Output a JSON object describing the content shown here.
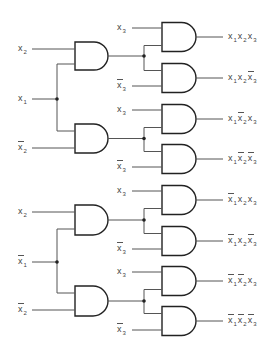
{
  "diagram": {
    "title": "Two-level AND decoder for x1, x2, x3 (minterm generator)",
    "stage1": {
      "inputs_top": [
        {
          "id": "in-x2-a",
          "terms": [
            {
              "var": "x",
              "sub": "2",
              "neg": false
            }
          ],
          "y": 49
        },
        {
          "id": "in-x1",
          "terms": [
            {
              "var": "x",
              "sub": "1",
              "neg": false
            }
          ],
          "y": 99
        },
        {
          "id": "in-x2bar-a",
          "terms": [
            {
              "var": "x",
              "sub": "2",
              "neg": true
            }
          ],
          "y": 148
        }
      ],
      "inputs_bottom": [
        {
          "id": "in-x2-b",
          "terms": [
            {
              "var": "x",
              "sub": "2",
              "neg": false
            }
          ],
          "y": 212
        },
        {
          "id": "in-x1bar",
          "terms": [
            {
              "var": "x",
              "sub": "1",
              "neg": true
            }
          ],
          "y": 262
        },
        {
          "id": "in-x2bar-b",
          "terms": [
            {
              "var": "x",
              "sub": "2",
              "neg": true
            }
          ],
          "y": 310
        }
      ]
    },
    "stage2_inputs": [
      {
        "terms": [
          {
            "var": "x",
            "sub": "3",
            "neg": false
          }
        ],
        "y": 28
      },
      {
        "terms": [
          {
            "var": "x",
            "sub": "3",
            "neg": true
          }
        ],
        "y": 86
      },
      {
        "terms": [
          {
            "var": "x",
            "sub": "3",
            "neg": false
          }
        ],
        "y": 110
      },
      {
        "terms": [
          {
            "var": "x",
            "sub": "3",
            "neg": true
          }
        ],
        "y": 167
      },
      {
        "terms": [
          {
            "var": "x",
            "sub": "3",
            "neg": false
          }
        ],
        "y": 191
      },
      {
        "terms": [
          {
            "var": "x",
            "sub": "3",
            "neg": true
          }
        ],
        "y": 249
      },
      {
        "terms": [
          {
            "var": "x",
            "sub": "3",
            "neg": false
          }
        ],
        "y": 272
      },
      {
        "terms": [
          {
            "var": "x",
            "sub": "3",
            "neg": true
          }
        ],
        "y": 330
      }
    ],
    "outputs": [
      {
        "label": "x1 x2 x3",
        "terms": [
          {
            "var": "x",
            "sub": "1",
            "neg": false
          },
          {
            "var": "x",
            "sub": "2",
            "neg": false
          },
          {
            "var": "x",
            "sub": "3",
            "neg": false
          }
        ],
        "y": 37
      },
      {
        "label": "x1 x2 x3'",
        "terms": [
          {
            "var": "x",
            "sub": "1",
            "neg": false
          },
          {
            "var": "x",
            "sub": "2",
            "neg": false
          },
          {
            "var": "x",
            "sub": "3",
            "neg": true
          }
        ],
        "y": 78
      },
      {
        "label": "x1 x2' x3",
        "terms": [
          {
            "var": "x",
            "sub": "1",
            "neg": false
          },
          {
            "var": "x",
            "sub": "2",
            "neg": true
          },
          {
            "var": "x",
            "sub": "3",
            "neg": false
          }
        ],
        "y": 119
      },
      {
        "label": "x1 x2' x3'",
        "terms": [
          {
            "var": "x",
            "sub": "1",
            "neg": false
          },
          {
            "var": "x",
            "sub": "2",
            "neg": true
          },
          {
            "var": "x",
            "sub": "3",
            "neg": true
          }
        ],
        "y": 159
      },
      {
        "label": "x1' x2 x3",
        "terms": [
          {
            "var": "x",
            "sub": "1",
            "neg": true
          },
          {
            "var": "x",
            "sub": "2",
            "neg": false
          },
          {
            "var": "x",
            "sub": "3",
            "neg": false
          }
        ],
        "y": 200
      },
      {
        "label": "x1' x2 x3'",
        "terms": [
          {
            "var": "x",
            "sub": "1",
            "neg": true
          },
          {
            "var": "x",
            "sub": "2",
            "neg": false
          },
          {
            "var": "x",
            "sub": "3",
            "neg": true
          }
        ],
        "y": 241
      },
      {
        "label": "x1' x2' x3",
        "terms": [
          {
            "var": "x",
            "sub": "1",
            "neg": true
          },
          {
            "var": "x",
            "sub": "2",
            "neg": true
          },
          {
            "var": "x",
            "sub": "3",
            "neg": false
          }
        ],
        "y": 281
      },
      {
        "label": "x1' x2' x3'",
        "terms": [
          {
            "var": "x",
            "sub": "1",
            "neg": true
          },
          {
            "var": "x",
            "sub": "2",
            "neg": true
          },
          {
            "var": "x",
            "sub": "3",
            "neg": true
          }
        ],
        "y": 321
      }
    ],
    "gate_type": "AND",
    "gate_count": 12,
    "colors": {
      "wire": "#555555",
      "gate_stroke": "#222222",
      "text": "#444444"
    }
  }
}
